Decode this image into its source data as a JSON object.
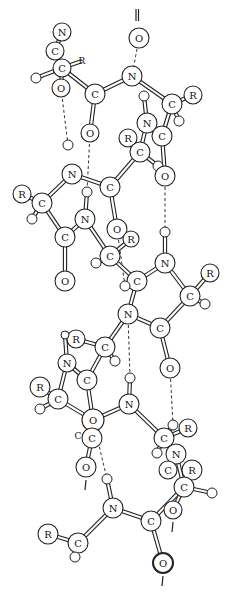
{
  "colors": {
    "ink": "#222222",
    "background": "#ffffff"
  },
  "atoms": [
    {
      "id": "n1",
      "el": "N",
      "label": "N",
      "x": 62,
      "y": 32,
      "r": 9
    },
    {
      "id": "c1",
      "el": "C",
      "label": "C",
      "x": 55,
      "y": 51,
      "r": 9
    },
    {
      "id": "c2",
      "el": "C",
      "label": "C",
      "x": 62,
      "y": 68,
      "r": 9
    },
    {
      "id": "r1",
      "el": "R",
      "label": "R",
      "x": 82,
      "y": 61,
      "r": 0
    },
    {
      "id": "h1",
      "el": "H",
      "label": "",
      "x": 36,
      "y": 78,
      "r": 5
    },
    {
      "id": "o1",
      "el": "O",
      "label": "O",
      "x": 61,
      "y": 88,
      "r": 9
    },
    {
      "id": "c3",
      "el": "C",
      "label": "C",
      "x": 95,
      "y": 94,
      "r": 10
    },
    {
      "id": "o2",
      "el": "O",
      "label": "O",
      "x": 90,
      "y": 133,
      "r": 9
    },
    {
      "id": "n2",
      "el": "N",
      "label": "N",
      "x": 132,
      "y": 76,
      "r": 10
    },
    {
      "id": "o3",
      "el": "O",
      "label": "O",
      "x": 139,
      "y": 38,
      "r": 10
    },
    {
      "id": "h2",
      "el": "H",
      "label": "",
      "x": 144,
      "y": 96,
      "r": 5
    },
    {
      "id": "c4",
      "el": "C",
      "label": "C",
      "x": 172,
      "y": 104,
      "r": 10
    },
    {
      "id": "r2",
      "el": "R",
      "label": "R",
      "x": 193,
      "y": 95,
      "r": 9
    },
    {
      "id": "h3",
      "el": "H",
      "label": "",
      "x": 179,
      "y": 121,
      "r": 5
    },
    {
      "id": "n3",
      "el": "N",
      "label": "N",
      "x": 147,
      "y": 123,
      "r": 10
    },
    {
      "id": "c5",
      "el": "C",
      "label": "C",
      "x": 162,
      "y": 136,
      "r": 10
    },
    {
      "id": "r3",
      "el": "R",
      "label": "R",
      "x": 128,
      "y": 138,
      "r": 9
    },
    {
      "id": "c6",
      "el": "C",
      "label": "C",
      "x": 140,
      "y": 152,
      "r": 10
    },
    {
      "id": "h4",
      "el": "H",
      "label": "",
      "x": 158,
      "y": 166,
      "r": 5
    },
    {
      "id": "o4",
      "el": "O",
      "label": "O",
      "x": 165,
      "y": 176,
      "r": 10
    },
    {
      "id": "h5",
      "el": "H",
      "label": "",
      "x": 68,
      "y": 145,
      "r": 5
    },
    {
      "id": "n4",
      "el": "N",
      "label": "N",
      "x": 72,
      "y": 174,
      "r": 10
    },
    {
      "id": "r4",
      "el": "R",
      "label": "R",
      "x": 22,
      "y": 194,
      "r": 9
    },
    {
      "id": "c7",
      "el": "C",
      "label": "C",
      "x": 42,
      "y": 203,
      "r": 10
    },
    {
      "id": "h6",
      "el": "H",
      "label": "",
      "x": 32,
      "y": 219,
      "r": 5
    },
    {
      "id": "c8",
      "el": "C",
      "label": "C",
      "x": 65,
      "y": 237,
      "r": 10
    },
    {
      "id": "o5",
      "el": "O",
      "label": "O",
      "x": 65,
      "y": 281,
      "r": 10
    },
    {
      "id": "h7",
      "el": "H",
      "label": "",
      "x": 87,
      "y": 192,
      "r": 5
    },
    {
      "id": "n5",
      "el": "N",
      "label": "N",
      "x": 85,
      "y": 219,
      "r": 10
    },
    {
      "id": "c9",
      "el": "C",
      "label": "C",
      "x": 110,
      "y": 187,
      "r": 10
    },
    {
      "id": "o6",
      "el": "O",
      "label": "O",
      "x": 117,
      "y": 229,
      "r": 10
    },
    {
      "id": "r5",
      "el": "R",
      "label": "R",
      "x": 131,
      "y": 239,
      "r": 8
    },
    {
      "id": "c10",
      "el": "C",
      "label": "C",
      "x": 110,
      "y": 256,
      "r": 10
    },
    {
      "id": "h8",
      "el": "H",
      "label": "",
      "x": 96,
      "y": 263,
      "r": 5
    },
    {
      "id": "h9",
      "el": "H",
      "label": "",
      "x": 165,
      "y": 232,
      "r": 5
    },
    {
      "id": "n6",
      "el": "N",
      "label": "N",
      "x": 165,
      "y": 263,
      "r": 10
    },
    {
      "id": "c11",
      "el": "C",
      "label": "C",
      "x": 137,
      "y": 281,
      "r": 10
    },
    {
      "id": "h10",
      "el": "H",
      "label": "",
      "x": 125,
      "y": 286,
      "r": 5
    },
    {
      "id": "r6",
      "el": "R",
      "label": "R",
      "x": 210,
      "y": 273,
      "r": 9
    },
    {
      "id": "c12",
      "el": "C",
      "label": "C",
      "x": 190,
      "y": 296,
      "r": 10
    },
    {
      "id": "h11",
      "el": "H",
      "label": "",
      "x": 205,
      "y": 304,
      "r": 5
    },
    {
      "id": "n7",
      "el": "N",
      "label": "N",
      "x": 128,
      "y": 314,
      "r": 10
    },
    {
      "id": "c13",
      "el": "C",
      "label": "C",
      "x": 160,
      "y": 328,
      "r": 10
    },
    {
      "id": "o7",
      "el": "O",
      "label": "O",
      "x": 170,
      "y": 368,
      "r": 10
    },
    {
      "id": "r7",
      "el": "R",
      "label": "R",
      "x": 76,
      "y": 339,
      "r": 9
    },
    {
      "id": "h12",
      "el": "H",
      "label": "",
      "x": 65,
      "y": 335,
      "r": 4
    },
    {
      "id": "c14",
      "el": "C",
      "label": "C",
      "x": 105,
      "y": 347,
      "r": 10
    },
    {
      "id": "h13",
      "el": "H",
      "label": "",
      "x": 115,
      "y": 361,
      "r": 5
    },
    {
      "id": "n8",
      "el": "N",
      "label": "N",
      "x": 67,
      "y": 363,
      "r": 9
    },
    {
      "id": "c15",
      "el": "C",
      "label": "C",
      "x": 87,
      "y": 380,
      "r": 10
    },
    {
      "id": "h14",
      "el": "H",
      "label": "",
      "x": 130,
      "y": 378,
      "r": 5
    },
    {
      "id": "r8",
      "el": "R",
      "label": "R",
      "x": 40,
      "y": 387,
      "r": 10
    },
    {
      "id": "c16",
      "el": "C",
      "label": "C",
      "x": 58,
      "y": 399,
      "r": 10
    },
    {
      "id": "h15",
      "el": "H",
      "label": "",
      "x": 40,
      "y": 409,
      "r": 5
    },
    {
      "id": "o8",
      "el": "O",
      "label": "O",
      "x": 93,
      "y": 420,
      "r": 11
    },
    {
      "id": "c17",
      "el": "C",
      "label": "C",
      "x": 92,
      "y": 438,
      "r": 10
    },
    {
      "id": "n9",
      "el": "N",
      "label": "N",
      "x": 129,
      "y": 404,
      "r": 10
    },
    {
      "id": "o9",
      "el": "O",
      "label": "O",
      "x": 86,
      "y": 467,
      "r": 10
    },
    {
      "id": "h16",
      "el": "H",
      "label": "",
      "x": 107,
      "y": 479,
      "r": 5
    },
    {
      "id": "h17",
      "el": "H",
      "label": "",
      "x": 173,
      "y": 425,
      "r": 5
    },
    {
      "id": "r9",
      "el": "R",
      "label": "R",
      "x": 188,
      "y": 428,
      "r": 9
    },
    {
      "id": "c18",
      "el": "C",
      "label": "C",
      "x": 164,
      "y": 438,
      "r": 10
    },
    {
      "id": "h18",
      "el": "H",
      "label": "",
      "x": 157,
      "y": 453,
      "r": 5
    },
    {
      "id": "n10",
      "el": "N",
      "label": "N",
      "x": 176,
      "y": 454,
      "r": 10
    },
    {
      "id": "c19",
      "el": "C",
      "label": "C",
      "x": 168,
      "y": 470,
      "r": 9
    },
    {
      "id": "r10",
      "el": "R",
      "label": "R",
      "x": 192,
      "y": 470,
      "r": 10
    },
    {
      "id": "c20",
      "el": "C",
      "label": "C",
      "x": 184,
      "y": 487,
      "r": 10
    },
    {
      "id": "h19",
      "el": "H",
      "label": "",
      "x": 212,
      "y": 493,
      "r": 5
    },
    {
      "id": "o10",
      "el": "O",
      "label": "O",
      "x": 173,
      "y": 510,
      "r": 9
    },
    {
      "id": "n11",
      "el": "N",
      "label": "N",
      "x": 113,
      "y": 508,
      "r": 10
    },
    {
      "id": "c21",
      "el": "C",
      "label": "C",
      "x": 151,
      "y": 521,
      "r": 10
    },
    {
      "id": "o11",
      "el": "O",
      "label": "O",
      "x": 163,
      "y": 563,
      "r": 10,
      "bold": true
    },
    {
      "id": "r11",
      "el": "R",
      "label": "R",
      "x": 48,
      "y": 534,
      "r": 10
    },
    {
      "id": "c22",
      "el": "C",
      "label": "C",
      "x": 78,
      "y": 543,
      "r": 10
    },
    {
      "id": "h20",
      "el": "H",
      "label": "",
      "x": 75,
      "y": 557,
      "r": 5
    }
  ],
  "bonds": [
    [
      "n1",
      "c1"
    ],
    [
      "c1",
      "c2"
    ],
    [
      "c2",
      "o1"
    ],
    [
      "c2",
      "c3"
    ],
    [
      "h1",
      "c2"
    ],
    [
      "c2",
      "r1"
    ],
    [
      "c3",
      "o2"
    ],
    [
      "c3",
      "n2"
    ],
    [
      "n2",
      "c4"
    ],
    [
      "c4",
      "r2"
    ],
    [
      "c4",
      "h3"
    ],
    [
      "n3",
      "h2"
    ],
    [
      "n3",
      "c5"
    ],
    [
      "c5",
      "c4"
    ],
    [
      "n3",
      "c6"
    ],
    [
      "r3",
      "c6"
    ],
    [
      "c6",
      "h4"
    ],
    [
      "h4",
      "o4"
    ],
    [
      "c5",
      "o4"
    ],
    [
      "c6",
      "c9"
    ],
    [
      "c9",
      "o6"
    ],
    [
      "c9",
      "n4"
    ],
    [
      "n4",
      "c7"
    ],
    [
      "c7",
      "r4"
    ],
    [
      "c7",
      "h6"
    ],
    [
      "c7",
      "c8"
    ],
    [
      "c8",
      "o5"
    ],
    [
      "c8",
      "n5"
    ],
    [
      "n5",
      "h7"
    ],
    [
      "n5",
      "c10"
    ],
    [
      "c10",
      "h8"
    ],
    [
      "c10",
      "r5"
    ],
    [
      "c10",
      "c11"
    ],
    [
      "c11",
      "n6"
    ],
    [
      "n6",
      "h9"
    ],
    [
      "n6",
      "c12"
    ],
    [
      "c12",
      "r6"
    ],
    [
      "c12",
      "h11"
    ],
    [
      "c12",
      "c13"
    ],
    [
      "c11",
      "h10"
    ],
    [
      "c11",
      "n7"
    ],
    [
      "n7",
      "c13"
    ],
    [
      "c13",
      "o7"
    ],
    [
      "n7",
      "c14"
    ],
    [
      "c14",
      "r7"
    ],
    [
      "c14",
      "h13"
    ],
    [
      "c14",
      "c15"
    ],
    [
      "r7",
      "h12"
    ],
    [
      "h12",
      "n8"
    ],
    [
      "n8",
      "c15"
    ],
    [
      "n8",
      "c16"
    ],
    [
      "c16",
      "r8"
    ],
    [
      "c16",
      "h15"
    ],
    [
      "c16",
      "o8"
    ],
    [
      "c15",
      "o8"
    ],
    [
      "o8",
      "c17"
    ],
    [
      "o8",
      "n9"
    ],
    [
      "c17",
      "o9"
    ],
    [
      "n9",
      "h14"
    ],
    [
      "n9",
      "c18"
    ],
    [
      "c18",
      "r9"
    ],
    [
      "c18",
      "h17"
    ],
    [
      "c18",
      "h18"
    ],
    [
      "c18",
      "n10"
    ],
    [
      "n10",
      "c19"
    ],
    [
      "n10",
      "c20"
    ],
    [
      "c20",
      "r10"
    ],
    [
      "c20",
      "h19"
    ],
    [
      "c20",
      "o10"
    ],
    [
      "c20",
      "c21"
    ],
    [
      "c21",
      "o11"
    ],
    [
      "c21",
      "n11"
    ],
    [
      "n11",
      "h16"
    ],
    [
      "n11",
      "c22"
    ],
    [
      "c22",
      "r11"
    ],
    [
      "c22",
      "h20"
    ]
  ],
  "double_bonds": [
    [
      "n1",
      "c1"
    ],
    [
      "c3",
      "o2"
    ],
    [
      "c8",
      "o5"
    ],
    [
      "c9",
      "o6"
    ],
    [
      "c13",
      "o7"
    ],
    [
      "c17",
      "o9"
    ],
    [
      "c21",
      "o11"
    ],
    [
      "n2",
      "o3"
    ],
    [
      "n5",
      "h7"
    ],
    [
      "n6",
      "h9"
    ],
    [
      "n7",
      "c11"
    ],
    [
      "n11",
      "h16"
    ]
  ],
  "hydrogen_bonds": [
    [
      "o1",
      "h5"
    ],
    [
      "o3",
      "n2"
    ],
    [
      "o2",
      "h7"
    ],
    [
      "o4",
      "h9"
    ],
    [
      "o6",
      "h10"
    ],
    [
      "n7",
      "h14"
    ],
    [
      "o7",
      "h17"
    ],
    [
      "o8",
      "h16"
    ]
  ],
  "stubs": [
    {
      "from": "o3",
      "dir": "up"
    },
    {
      "from": "o9",
      "dir": "down"
    },
    {
      "from": "o10",
      "dir": "down"
    },
    {
      "from": "o11",
      "dir": "down"
    }
  ],
  "free_labels": [
    {
      "text": "R",
      "x": 82,
      "y": 61
    },
    {
      "text": "C",
      "x": 78,
      "y": 436
    }
  ]
}
